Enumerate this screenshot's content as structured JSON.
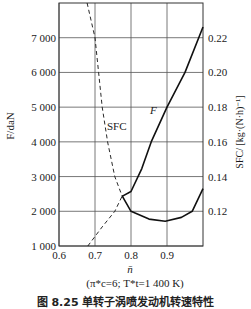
{
  "chart_data": {
    "type": "line",
    "title": "",
    "caption": "图 8.25   单转子涡喷发动机转速特性",
    "subtitle": "(π*c=6; T*t=1 400 K)",
    "xlabel": "n̄",
    "ylabel_left": "F/daN",
    "ylabel_right": "SFC/ [kg·(N·h)⁻¹]",
    "xlim": [
      0.6,
      1.0
    ],
    "ylim_left": [
      1000,
      8000
    ],
    "ylim_right": [
      0.1,
      0.24
    ],
    "x_ticks": [
      "0.6",
      "0.7",
      "0.8",
      "0.9"
    ],
    "y_left_ticks": [
      "1 000",
      "2 000",
      "3 000",
      "4 000",
      "5 000",
      "6 000",
      "7 000"
    ],
    "y_right_ticks": [
      "0.12",
      "0.14",
      "0.16",
      "0.18",
      "0.20",
      "0.22"
    ],
    "grid": true,
    "series": [
      {
        "name": "F",
        "axis": "left",
        "label": "F",
        "solid_segment": {
          "x": [
            0.775,
            0.8,
            0.83,
            0.856,
            0.9,
            0.95,
            1.0
          ],
          "y": [
            2430,
            2570,
            3230,
            4000,
            5000,
            6000,
            7310
          ]
        },
        "dashed_segment": {
          "x": [
            0.68,
            0.72,
            0.755,
            0.775
          ],
          "y": [
            1000,
            1550,
            2000,
            2430
          ]
        }
      },
      {
        "name": "SFC",
        "axis": "right",
        "label": "SFC",
        "dashed_segment": {
          "x": [
            0.678,
            0.7,
            0.71,
            0.72,
            0.735,
            0.755,
            0.775
          ],
          "y": [
            0.24,
            0.22,
            0.2,
            0.18,
            0.16,
            0.14,
            0.129
          ]
        },
        "solid_segment": {
          "x": [
            0.775,
            0.8,
            0.85,
            0.895,
            0.94,
            0.97,
            1.0
          ],
          "y": [
            0.129,
            0.12,
            0.1155,
            0.1143,
            0.1165,
            0.12,
            0.133
          ]
        }
      }
    ]
  }
}
